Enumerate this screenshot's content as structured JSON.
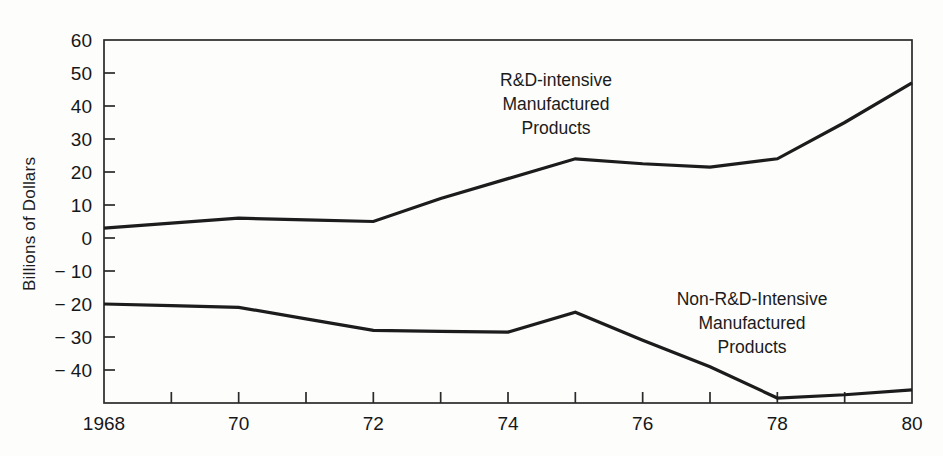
{
  "chart_data": {
    "type": "line",
    "title": "",
    "xlabel": "",
    "ylabel": "Billions of Dollars",
    "xlim": [
      1968,
      1980
    ],
    "ylim": [
      -50,
      60
    ],
    "grid": false,
    "legend_position": "inline-annotation",
    "x": [
      1968,
      1969,
      1970,
      1971,
      1972,
      1973,
      1974,
      1975,
      1976,
      1977,
      1978,
      1979,
      1980
    ],
    "xtick_values": [
      1968,
      1970,
      1972,
      1974,
      1976,
      1978,
      1980
    ],
    "xtick_labels": [
      "1968",
      "70",
      "72",
      "74",
      "76",
      "78",
      "80"
    ],
    "xminor_tick_values": [
      1969,
      1971,
      1973,
      1975,
      1977,
      1979
    ],
    "ytick_values": [
      60,
      50,
      40,
      30,
      20,
      10,
      0,
      -10,
      -20,
      -30,
      -40
    ],
    "ytick_labels": [
      "60",
      "50",
      "40",
      "30",
      "20",
      "10",
      "0",
      "− 10",
      "− 20",
      "− 30",
      "− 40"
    ],
    "series": [
      {
        "name": "R&D-intensive Manufactured Products",
        "values": [
          3.0,
          4.5,
          6.0,
          5.5,
          5.0,
          12.0,
          18.0,
          24.0,
          22.5,
          21.5,
          24.0,
          35.0,
          47.0
        ]
      },
      {
        "name": "Non-R&D-Intensive Manufactured Products",
        "values": [
          -20.0,
          -20.5,
          -21.0,
          -24.5,
          -28.0,
          -28.3,
          -28.5,
          -22.5,
          -31.0,
          -39.0,
          -48.5,
          -47.5,
          -46.0
        ]
      }
    ],
    "annotations": [
      {
        "id": "upper",
        "lines": [
          "R&D-intensive",
          "Manufactured",
          "Products"
        ],
        "series": "R&D-intensive Manufactured Products"
      },
      {
        "id": "lower",
        "lines": [
          "Non-R&D-Intensive",
          "Manufactured",
          "Products"
        ],
        "series": "Non-R&D-Intensive Manufactured Products"
      }
    ],
    "colors": {
      "line": "#1c1c1c",
      "axis": "#2a2a2a",
      "text": "#171717",
      "background": "#fdfdfc"
    }
  }
}
